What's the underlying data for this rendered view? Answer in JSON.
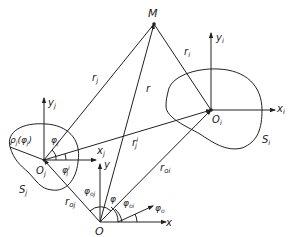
{
  "diagram": {
    "points": {
      "M": "M",
      "O": "O",
      "Oj": "O",
      "Oj_sub": "j",
      "Oi": "O",
      "Oi_sub": "i"
    },
    "regions": {
      "Sj": "S",
      "Sj_sub": "j",
      "Si": "S",
      "Si_sub": "i"
    },
    "vectors": {
      "rj": "r",
      "rj_sub": "j",
      "ri": "r",
      "ri_sub": "i",
      "r": "r",
      "rj_prime": "r",
      "rj_prime_sub": "j",
      "rj_prime_sup": "i",
      "roj": "r",
      "roj_sub": "oj",
      "roi": "r",
      "roi_sub": "oi"
    },
    "axes": {
      "x": "x",
      "y": "y",
      "xj": "x",
      "xj_sub": "j",
      "yj": "y",
      "yj_sub": "j",
      "xi": "x",
      "xi_sub": "i",
      "yi": "y",
      "yi_sub": "i"
    },
    "angles": {
      "phi": "φ",
      "phi_o": "φ",
      "phi_o_sub": "o",
      "phi_oj": "φ",
      "phi_oj_sub": "oj",
      "phi_oi": "φ",
      "phi_oi_sub": "oi",
      "phi_j": "φ",
      "phi_j_sub": "j",
      "phi_j_prime": "φ",
      "phi_j_prime_sub": "j",
      "phi_j_prime_sup": "i"
    },
    "boundary_function": "ρ",
    "boundary_function_sub": "j",
    "boundary_function_arg": "(φ",
    "boundary_function_arg_sub": "j",
    "boundary_function_close": ")"
  }
}
